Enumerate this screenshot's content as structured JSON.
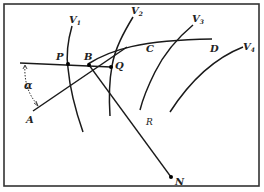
{
  "figure": {
    "colors": {
      "ink": "#1a1a1a",
      "background": "#ffffff",
      "frame": "#333333"
    },
    "frame": {
      "x": 4,
      "y": 4,
      "width": 255,
      "height": 182
    },
    "labels": {
      "P": "P",
      "B": "B",
      "Q": "Q",
      "C": "C",
      "D": "D",
      "A": "A",
      "R": "R",
      "N": "N",
      "alpha": "α",
      "V1": {
        "base": "V",
        "sub": "1"
      },
      "V2": {
        "base": "V",
        "sub": "2"
      },
      "V3": {
        "base": "V",
        "sub": "3"
      },
      "V4": {
        "base": "V",
        "sub": "4"
      }
    }
  }
}
